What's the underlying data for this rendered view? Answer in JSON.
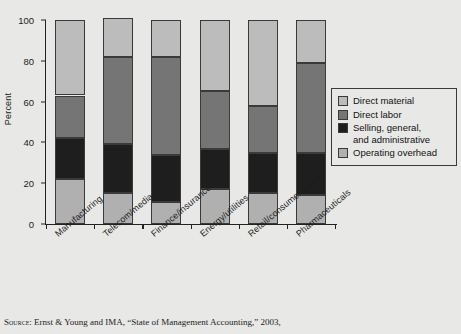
{
  "chart_data": {
    "type": "bar",
    "stacked": true,
    "title": "",
    "xlabel": "",
    "ylabel": "Percent",
    "ylim": [
      0,
      100
    ],
    "yticks": [
      0,
      20,
      40,
      60,
      80,
      100
    ],
    "grid": false,
    "legend_position": "right",
    "categories": [
      "Manufacturing",
      "Telecom/media",
      "Finance/insurance",
      "Energy/utilities",
      "Retail/consumer goods",
      "Pharmaceuticals"
    ],
    "series": [
      {
        "name": "Operating overhead",
        "color": "#b0b0b0",
        "values": [
          22,
          15,
          11,
          17,
          15,
          14
        ]
      },
      {
        "name": "Selling, general, and administrative",
        "color": "#1e1e1e",
        "values": [
          20,
          24,
          23,
          20,
          20,
          21
        ]
      },
      {
        "name": "Direct labor",
        "color": "#757575",
        "values": [
          21,
          43,
          48,
          28,
          23,
          44
        ]
      },
      {
        "name": "Direct material",
        "color": "#bcbcbc",
        "values": [
          37,
          19,
          18,
          35,
          42,
          21
        ]
      }
    ],
    "stack_order_bottom_to_top": [
      "Operating overhead",
      "Selling, general, and administrative",
      "Direct labor",
      "Direct material"
    ]
  },
  "legend": {
    "items": [
      {
        "label": "Direct material",
        "color": "#bcbcbc"
      },
      {
        "label": "Direct labor",
        "color": "#757575"
      },
      {
        "label": "Selling, general,",
        "label2": "and administrative",
        "color": "#1e1e1e"
      },
      {
        "label": "Operating overhead",
        "color": "#b0b0b0"
      }
    ]
  },
  "axis": {
    "ylabel": "Percent",
    "yticks": [
      "0",
      "20",
      "40",
      "60",
      "80",
      "100"
    ]
  },
  "source": {
    "prefix": "Source",
    "text": ": Ernst & Young and IMA, “State of Management Accounting,” 2003,"
  }
}
